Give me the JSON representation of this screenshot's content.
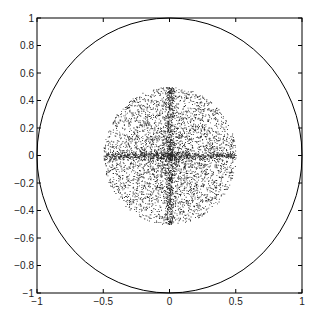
{
  "chart_data": {
    "type": "scatter",
    "title": "",
    "xlabel": "",
    "ylabel": "",
    "xlim": [
      -1,
      1
    ],
    "ylim": [
      -1,
      1
    ],
    "grid": false,
    "legend": null,
    "x_ticks": [
      "-1",
      "-0.5",
      "0",
      "0.5",
      "1"
    ],
    "y_ticks": [
      "1",
      "0.8",
      "0.6",
      "0.4",
      "0.2",
      "0",
      "-0.2",
      "-0.4",
      "-0.6",
      "-0.8",
      "-1"
    ],
    "series": [
      {
        "name": "unit circle",
        "kind": "line",
        "shape": "circle",
        "center": [
          0,
          0
        ],
        "radius": 1,
        "color": "#000000"
      },
      {
        "name": "points",
        "kind": "scatter",
        "color": "#000000",
        "distribution": "dense point cloud centered at origin, roughly circular with radius ~0.5, with concentrated cross along x=0 and y=0 axes",
        "extent": {
          "x": [
            -0.5,
            0.5
          ],
          "y": [
            -0.5,
            0.5
          ]
        },
        "approx_count": 6000
      }
    ]
  }
}
